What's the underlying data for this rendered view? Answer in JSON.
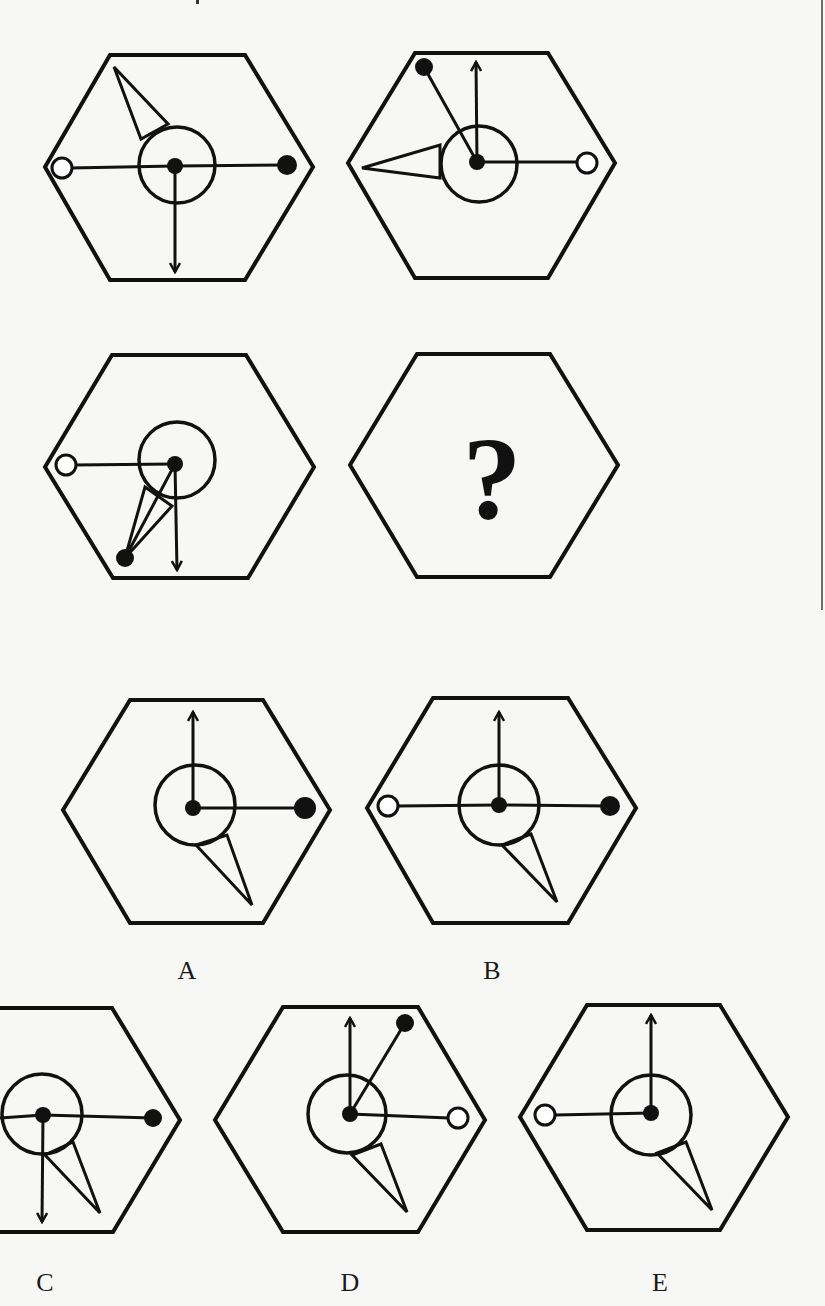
{
  "puzzle": {
    "question_mark": "?",
    "stroke_color": "#111111",
    "background_color": "#f7f7f5",
    "sequence": [
      {
        "id": "figure-1",
        "hexagon": [
          [
            110,
            55
          ],
          [
            245,
            55
          ],
          [
            313,
            167
          ],
          [
            245,
            280
          ],
          [
            110,
            280
          ],
          [
            45,
            167
          ]
        ],
        "circle": {
          "cx": 177,
          "cy": 165,
          "r": 38
        },
        "center_dot": {
          "cx": 175,
          "cy": 166,
          "r": 8
        },
        "lines": [
          {
            "x1": 175,
            "y1": 166,
            "x2": 70,
            "y2": 168
          },
          {
            "x1": 175,
            "y1": 166,
            "x2": 287,
            "y2": 165
          }
        ],
        "arrows": [
          {
            "x1": 175,
            "y1": 166,
            "x2": 175,
            "y2": 272,
            "dir": "down"
          }
        ],
        "open_circles": [
          {
            "cx": 62,
            "cy": 168,
            "r": 10
          }
        ],
        "filled_dots": [
          {
            "cx": 287,
            "cy": 165,
            "r": 10
          }
        ],
        "triangles": [
          [
            [
              114,
              67
            ],
            [
              141,
              139
            ],
            [
              168,
              124
            ]
          ]
        ]
      },
      {
        "id": "figure-2",
        "hexagon": [
          [
            415,
            53
          ],
          [
            548,
            53
          ],
          [
            615,
            163
          ],
          [
            548,
            278
          ],
          [
            415,
            278
          ],
          [
            348,
            163
          ]
        ],
        "circle": {
          "cx": 479,
          "cy": 164,
          "r": 38
        },
        "center_dot": {
          "cx": 477,
          "cy": 162,
          "r": 8
        },
        "lines": [
          {
            "x1": 477,
            "y1": 162,
            "x2": 424,
            "y2": 67
          },
          {
            "x1": 477,
            "y1": 162,
            "x2": 580,
            "y2": 162
          }
        ],
        "arrows": [
          {
            "x1": 477,
            "y1": 162,
            "x2": 476,
            "y2": 62,
            "dir": "up"
          }
        ],
        "open_circles": [
          {
            "cx": 587,
            "cy": 163,
            "r": 10
          }
        ],
        "filled_dots": [
          {
            "cx": 424,
            "cy": 67,
            "r": 9
          }
        ],
        "triangles": [
          [
            [
              362,
              168
            ],
            [
              440,
              145
            ],
            [
              440,
              178
            ]
          ]
        ]
      },
      {
        "id": "figure-3",
        "hexagon": [
          [
            112,
            355
          ],
          [
            246,
            355
          ],
          [
            314,
            467
          ],
          [
            248,
            578
          ],
          [
            113,
            578
          ],
          [
            45,
            467
          ]
        ],
        "circle": {
          "cx": 177,
          "cy": 460,
          "r": 38
        },
        "center_dot": {
          "cx": 175,
          "cy": 464,
          "r": 8
        },
        "lines": [
          {
            "x1": 175,
            "y1": 464,
            "x2": 73,
            "y2": 465
          }
        ],
        "arrows": [
          {
            "x1": 175,
            "y1": 464,
            "x2": 177,
            "y2": 570,
            "dir": "down"
          }
        ],
        "open_circles": [
          {
            "cx": 66,
            "cy": 465,
            "r": 10
          }
        ],
        "filled_dots": [
          {
            "cx": 125,
            "cy": 558,
            "r": 9
          }
        ],
        "triangles": [
          [
            [
              125,
              558
            ],
            [
              145,
              487
            ],
            [
              172,
              506
            ]
          ]
        ],
        "extra_lines": [
          {
            "x1": 125,
            "y1": 558,
            "x2": 175,
            "y2": 464
          }
        ]
      },
      {
        "id": "figure-4-unknown",
        "hexagon": [
          [
            417,
            354
          ],
          [
            550,
            354
          ],
          [
            618,
            465
          ],
          [
            550,
            577
          ],
          [
            417,
            577
          ],
          [
            350,
            465
          ]
        ],
        "question_mark": true,
        "question_pos": {
          "x": 492,
          "y": 420
        }
      }
    ],
    "options": [
      {
        "label": "A",
        "label_pos": {
          "x": 187,
          "y": 958
        },
        "hexagon": [
          [
            130,
            700
          ],
          [
            263,
            700
          ],
          [
            330,
            810
          ],
          [
            263,
            923
          ],
          [
            130,
            923
          ],
          [
            63,
            810
          ]
        ],
        "circle": {
          "cx": 195,
          "cy": 805,
          "r": 40
        },
        "center_dot": {
          "cx": 193,
          "cy": 808,
          "r": 8
        },
        "lines": [
          {
            "x1": 193,
            "y1": 808,
            "x2": 305,
            "y2": 808
          }
        ],
        "arrows": [
          {
            "x1": 193,
            "y1": 808,
            "x2": 193,
            "y2": 712,
            "dir": "up"
          }
        ],
        "open_circles": [],
        "filled_dots": [
          {
            "cx": 305,
            "cy": 808,
            "r": 11
          }
        ],
        "triangles": [
          [
            [
              252,
              905
            ],
            [
              196,
              845
            ],
            [
              227,
              835
            ]
          ]
        ]
      },
      {
        "label": "B",
        "label_pos": {
          "x": 492,
          "y": 958
        },
        "hexagon": [
          [
            433,
            698
          ],
          [
            568,
            698
          ],
          [
            636,
            808
          ],
          [
            568,
            923
          ],
          [
            433,
            923
          ],
          [
            367,
            808
          ]
        ],
        "circle": {
          "cx": 499,
          "cy": 805,
          "r": 40
        },
        "center_dot": {
          "cx": 499,
          "cy": 805,
          "r": 8
        },
        "lines": [
          {
            "x1": 499,
            "y1": 805,
            "x2": 397,
            "y2": 806
          },
          {
            "x1": 499,
            "y1": 805,
            "x2": 610,
            "y2": 806
          }
        ],
        "arrows": [
          {
            "x1": 499,
            "y1": 805,
            "x2": 499,
            "y2": 712,
            "dir": "up"
          }
        ],
        "open_circles": [
          {
            "cx": 388,
            "cy": 806,
            "r": 10
          }
        ],
        "filled_dots": [
          {
            "cx": 610,
            "cy": 806,
            "r": 10
          }
        ],
        "triangles": [
          [
            [
              557,
              902
            ],
            [
              502,
              845
            ],
            [
              531,
              834
            ]
          ]
        ]
      },
      {
        "label": "C",
        "label_pos": {
          "x": 45,
          "y": 1270
        },
        "hexagon": [
          [
            -22,
            1008
          ],
          [
            112,
            1008
          ],
          [
            180,
            1120
          ],
          [
            113,
            1232
          ],
          [
            -22,
            1232
          ],
          [
            -90,
            1120
          ]
        ],
        "circle": {
          "cx": 42,
          "cy": 1114,
          "r": 40
        },
        "center_dot": {
          "cx": 43,
          "cy": 1115,
          "r": 8
        },
        "lines": [
          {
            "x1": 43,
            "y1": 1115,
            "x2": 153,
            "y2": 1118
          },
          {
            "x1": 43,
            "y1": 1115,
            "x2": 0,
            "y2": 1118
          }
        ],
        "arrows": [
          {
            "x1": 43,
            "y1": 1115,
            "x2": 42,
            "y2": 1222,
            "dir": "down"
          }
        ],
        "open_circles": [],
        "filled_dots": [
          {
            "cx": 153,
            "cy": 1118,
            "r": 9
          }
        ],
        "triangles": [
          [
            [
              100,
              1213
            ],
            [
              45,
              1155
            ],
            [
              73,
              1142
            ]
          ]
        ]
      },
      {
        "label": "D",
        "label_pos": {
          "x": 350,
          "y": 1270
        },
        "hexagon": [
          [
            283,
            1007
          ],
          [
            418,
            1007
          ],
          [
            485,
            1120
          ],
          [
            418,
            1232
          ],
          [
            283,
            1232
          ],
          [
            215,
            1120
          ]
        ],
        "circle": {
          "cx": 347,
          "cy": 1114,
          "r": 39
        },
        "center_dot": {
          "cx": 350,
          "cy": 1114,
          "r": 8
        },
        "lines": [
          {
            "x1": 350,
            "y1": 1114,
            "x2": 405,
            "y2": 1023
          },
          {
            "x1": 350,
            "y1": 1114,
            "x2": 449,
            "y2": 1118
          }
        ],
        "arrows": [
          {
            "x1": 350,
            "y1": 1114,
            "x2": 350,
            "y2": 1018,
            "dir": "up"
          }
        ],
        "open_circles": [
          {
            "cx": 458,
            "cy": 1118,
            "r": 10
          }
        ],
        "filled_dots": [
          {
            "cx": 405,
            "cy": 1023,
            "r": 9
          }
        ],
        "triangles": [
          [
            [
              407,
              1212
            ],
            [
              352,
              1155
            ],
            [
              381,
              1144
            ]
          ]
        ]
      },
      {
        "label": "E",
        "label_pos": {
          "x": 660,
          "y": 1270
        },
        "hexagon": [
          [
            587,
            1005
          ],
          [
            720,
            1005
          ],
          [
            788,
            1117
          ],
          [
            720,
            1230
          ],
          [
            587,
            1230
          ],
          [
            520,
            1117
          ]
        ],
        "circle": {
          "cx": 651,
          "cy": 1115,
          "r": 40
        },
        "center_dot": {
          "cx": 651,
          "cy": 1113,
          "r": 8
        },
        "lines": [
          {
            "x1": 651,
            "y1": 1113,
            "x2": 555,
            "y2": 1115
          }
        ],
        "arrows": [
          {
            "x1": 651,
            "y1": 1113,
            "x2": 651,
            "y2": 1015,
            "dir": "up"
          }
        ],
        "open_circles": [
          {
            "cx": 545,
            "cy": 1115,
            "r": 10
          }
        ],
        "filled_dots": [],
        "triangles": [
          [
            [
              712,
              1210
            ],
            [
              657,
              1153
            ],
            [
              686,
              1142
            ]
          ]
        ]
      }
    ]
  }
}
